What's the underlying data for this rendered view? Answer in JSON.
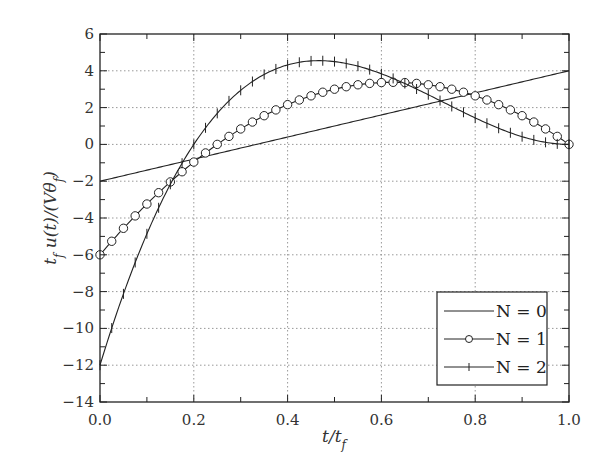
{
  "chart_data": {
    "type": "line",
    "title": "",
    "xlabel": "t/t_f",
    "ylabel": "t_f u(t)/(Vθ_f)",
    "xlim": [
      0.0,
      1.0
    ],
    "ylim": [
      -14,
      6
    ],
    "xticks": [
      "0.0",
      "0.2",
      "0.4",
      "0.6",
      "0.8",
      "1.0"
    ],
    "yticks": [
      "6",
      "4",
      "2",
      "0",
      "−2",
      "−4",
      "−6",
      "−8",
      "−10",
      "−12",
      "−14"
    ],
    "grid": true,
    "legend_position": "lower right",
    "series": [
      {
        "name": "N = 0",
        "marker": "none",
        "formula": "-2 + 6t",
        "x": [
          0,
          0.2,
          0.4,
          0.6,
          0.8,
          1.0
        ],
        "values": [
          -2,
          -0.8,
          0.4,
          1.6,
          2.8,
          4.0
        ]
      },
      {
        "name": "N = 1",
        "marker": "circle",
        "formula": "-6 + 30t - 24t^2",
        "x": [
          0,
          0.1,
          0.2,
          0.3,
          0.4,
          0.5,
          0.6,
          0.7,
          0.8,
          0.9,
          1.0
        ],
        "values": [
          -6,
          -3.24,
          -0.96,
          0.84,
          2.16,
          3.0,
          3.36,
          3.24,
          2.64,
          1.56,
          0
        ]
      },
      {
        "name": "N = 2",
        "marker": "plus",
        "formula": "-12 + 84t - 132t^2 + 60t^3",
        "x": [
          0,
          0.1,
          0.2,
          0.3,
          0.4,
          0.5,
          0.6,
          0.7,
          0.8,
          0.9,
          1.0
        ],
        "values": [
          -12,
          -4.86,
          0.0,
          3.0,
          4.32,
          4.5,
          3.6,
          2.22,
          0.96,
          0.12,
          0
        ]
      }
    ]
  },
  "legend": {
    "items": [
      {
        "label": "N = 0"
      },
      {
        "label": "N = 1"
      },
      {
        "label": "N = 2"
      }
    ]
  }
}
